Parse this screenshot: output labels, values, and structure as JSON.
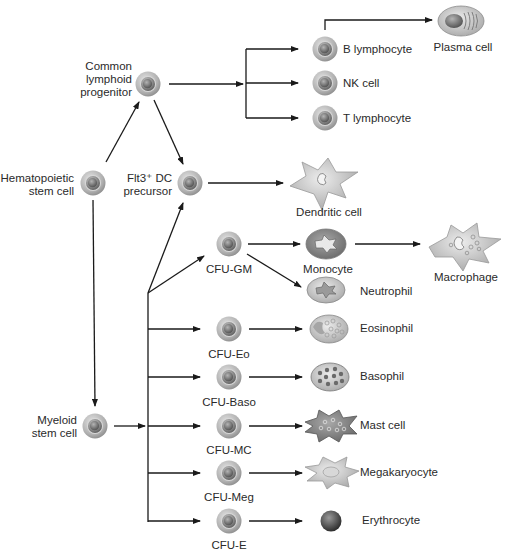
{
  "diagram": {
    "type": "hematopoiesis-lineage-tree",
    "nodes": {
      "hsc": {
        "line1": "Hematopoietic",
        "line2": "stem cell"
      },
      "clp": {
        "line1": "Common",
        "line2": "lymphoid",
        "line3": "progenitor"
      },
      "flt3": {
        "line1": "Flt3⁺ DC",
        "line2": "precursor"
      },
      "myeloid": {
        "line1": "Myeloid",
        "line2": "stem cell"
      },
      "b_lymphocyte": "B lymphocyte",
      "nk_cell": "NK cell",
      "t_lymphocyte": "T lymphocyte",
      "plasma_cell": "Plasma cell",
      "dendritic_cell": "Dendritic cell",
      "cfu_gm": "CFU-GM",
      "monocyte": "Monocyte",
      "macrophage": "Macrophage",
      "neutrophil": "Neutrophil",
      "cfu_eo": "CFU-Eo",
      "eosinophil": "Eosinophil",
      "cfu_baso": "CFU-Baso",
      "basophil": "Basophil",
      "cfu_mc": "CFU-MC",
      "mast_cell": "Mast cell",
      "cfu_meg": "CFU-Meg",
      "megakaryocyte": "Megakaryocyte",
      "cfu_e": "CFU-E",
      "erythrocyte": "Erythrocyte"
    },
    "edges": [
      [
        "Hematopoietic stem cell",
        "Common lymphoid progenitor"
      ],
      [
        "Hematopoietic stem cell",
        "Myeloid stem cell"
      ],
      [
        "Common lymphoid progenitor",
        "B lymphocyte"
      ],
      [
        "Common lymphoid progenitor",
        "NK cell"
      ],
      [
        "Common lymphoid progenitor",
        "T lymphocyte"
      ],
      [
        "Common lymphoid progenitor",
        "Flt3+ DC precursor"
      ],
      [
        "B lymphocyte",
        "Plasma cell"
      ],
      [
        "Flt3+ DC precursor",
        "Dendritic cell"
      ],
      [
        "Myeloid stem cell",
        "Flt3+ DC precursor"
      ],
      [
        "Myeloid stem cell",
        "CFU-GM"
      ],
      [
        "Myeloid stem cell",
        "CFU-Eo"
      ],
      [
        "Myeloid stem cell",
        "CFU-Baso"
      ],
      [
        "Myeloid stem cell",
        "CFU-MC"
      ],
      [
        "Myeloid stem cell",
        "CFU-Meg"
      ],
      [
        "Myeloid stem cell",
        "CFU-E"
      ],
      [
        "CFU-GM",
        "Monocyte"
      ],
      [
        "CFU-GM",
        "Neutrophil"
      ],
      [
        "Monocyte",
        "Macrophage"
      ],
      [
        "CFU-Eo",
        "Eosinophil"
      ],
      [
        "CFU-Baso",
        "Basophil"
      ],
      [
        "CFU-MC",
        "Mast cell"
      ],
      [
        "CFU-Meg",
        "Megakaryocyte"
      ],
      [
        "CFU-E",
        "Erythrocyte"
      ]
    ],
    "colors": {
      "line": "#1a1a1a",
      "cell_outer": "#b8b8b8",
      "cell_nucleus": "#6e6e6e",
      "mature_cell": "#cfcfcf",
      "erythrocyte": "#4a4a4a"
    }
  }
}
